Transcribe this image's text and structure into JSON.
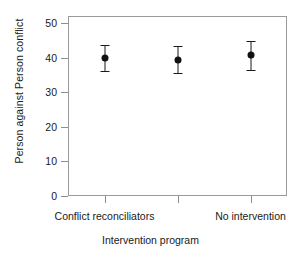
{
  "chart_data": {
    "type": "scatter",
    "title": "",
    "xlabel": "Intervention program",
    "ylabel": "Person against Person conflict",
    "categories": [
      "Conflict reconciliators",
      "",
      "No intervention"
    ],
    "xtick_labels": [
      "Conflict reconciliators",
      "",
      "No intervention"
    ],
    "ytick_labels": [
      "0",
      "10",
      "20",
      "30",
      "40",
      "50"
    ],
    "ytick_values": [
      0,
      10,
      20,
      30,
      40,
      50
    ],
    "ylim": [
      0,
      52
    ],
    "grid": false,
    "legend": "none",
    "series": [
      {
        "name": "Mean with 95% confidence interval",
        "values": [
          39.8,
          39.2,
          40.7
        ],
        "error_low": [
          36.0,
          35.4,
          36.3
        ],
        "error_high": [
          43.6,
          43.3,
          44.7
        ]
      }
    ],
    "points": [
      {
        "category": "Conflict reconciliators",
        "value": 39.8,
        "low": 36.0,
        "high": 43.6
      },
      {
        "category": "",
        "value": 39.2,
        "low": 35.4,
        "high": 43.3
      },
      {
        "category": "No intervention",
        "value": 40.7,
        "low": 36.3,
        "high": 44.7
      }
    ],
    "colors": {
      "marker": "#111111",
      "errorbar": "#1a1a1a",
      "frame": "#9a9a9a",
      "text": "#1a1a1a",
      "background": "#ffffff"
    }
  }
}
